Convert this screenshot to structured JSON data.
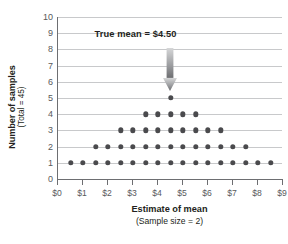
{
  "chart_data": {
    "type": "scatter",
    "title": "",
    "xlabel": "Estimate of mean",
    "xlabel_sub": "(Sample size = 2)",
    "ylabel": "Number of samples",
    "ylabel_sub": "(Total = 45)",
    "xlim": [
      0,
      9
    ],
    "ylim": [
      0,
      10
    ],
    "grid": true,
    "legend": "none",
    "x_tick_labels": [
      "$0",
      "$1",
      "$2",
      "$3",
      "$4",
      "$5",
      "$6",
      "$7",
      "$8",
      "$9"
    ],
    "x_tick_values": [
      0,
      1,
      2,
      3,
      4,
      5,
      6,
      7,
      8,
      9
    ],
    "y_tick_labels": [
      "0",
      "1",
      "2",
      "3",
      "4",
      "5",
      "6",
      "7",
      "8",
      "9",
      "10"
    ],
    "y_tick_values": [
      0,
      1,
      2,
      3,
      4,
      5,
      6,
      7,
      8,
      9,
      10
    ],
    "dot_color": "#4a4a4d",
    "grid_color": "#c8c9cb",
    "axis_color": "#6d6e71",
    "points": [
      {
        "y": 1,
        "x_values": [
          0.5,
          1.0,
          1.5,
          2.0,
          2.5,
          3.0,
          3.5,
          4.0,
          4.5,
          5.0,
          5.5,
          6.0,
          6.5,
          7.0,
          7.5,
          8.0,
          8.5
        ]
      },
      {
        "y": 2,
        "x_values": [
          1.5,
          2.0,
          2.5,
          3.0,
          3.5,
          4.0,
          4.5,
          5.0,
          5.5,
          6.0,
          6.5,
          7.0,
          7.5
        ]
      },
      {
        "y": 3,
        "x_values": [
          2.5,
          3.0,
          3.5,
          4.0,
          4.5,
          5.0,
          5.5,
          6.0,
          6.5
        ]
      },
      {
        "y": 4,
        "x_values": [
          3.5,
          4.0,
          4.5,
          5.0,
          5.5
        ]
      },
      {
        "y": 5,
        "x_values": [
          4.5
        ]
      }
    ],
    "counts_per_column": {
      "0.5": 1,
      "1.0": 1,
      "1.5": 2,
      "2.0": 2,
      "2.5": 3,
      "3.0": 3,
      "3.5": 4,
      "4.0": 4,
      "4.5": 5,
      "5.0": 4,
      "5.5": 4,
      "6.0": 3,
      "6.5": 3,
      "7.0": 2,
      "7.5": 2,
      "8.0": 1,
      "8.5": 1
    },
    "total_samples": 45,
    "annotation": {
      "text": "True mean  =  $4.50",
      "value": 4.5,
      "arrow_from_y": 8.1,
      "arrow_to_y": 5.45,
      "arrow_color_top": "#d6d7d8",
      "arrow_color_bottom": "#6d6e71"
    }
  }
}
